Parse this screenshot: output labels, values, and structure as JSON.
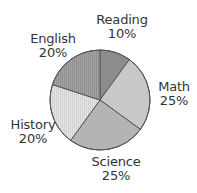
{
  "chart_data": {
    "type": "pie",
    "title": "",
    "categories": [
      "Reading",
      "Math",
      "Science",
      "History",
      "English"
    ],
    "values": [
      10,
      25,
      25,
      20,
      20
    ],
    "unit": "%",
    "start_angle": "12 o'clock",
    "direction": "clockwise",
    "slice_angles_note": "Slice angles are computed from the labeled percentages (which sum to 100%) and agree with the drawn slices to within reading precision.",
    "slices": [
      {
        "label": "Reading",
        "value": 10,
        "value_label": "10%",
        "fill": "#8c8c8c",
        "pattern": "none"
      },
      {
        "label": "Math",
        "value": 25,
        "value_label": "25%",
        "fill": "#c8c8c8",
        "pattern": "none"
      },
      {
        "label": "Science",
        "value": 25,
        "value_label": "25%",
        "fill": "#b4b4b4",
        "pattern": "none"
      },
      {
        "label": "History",
        "value": 20,
        "value_label": "20%",
        "fill": "#e2e2e2",
        "pattern": "vertical-hatch"
      },
      {
        "label": "English",
        "value": 20,
        "value_label": "20%",
        "fill": "#9e9e9e",
        "pattern": "vertical-hatch"
      }
    ],
    "legend": "none (direct labels)",
    "outline_color": "#555555"
  },
  "labels": {
    "reading": {
      "name": "Reading",
      "pct": "10%"
    },
    "math": {
      "name": "Math",
      "pct": "25%"
    },
    "science": {
      "name": "Science",
      "pct": "25%"
    },
    "history": {
      "name": "History",
      "pct": "20%"
    },
    "english": {
      "name": "English",
      "pct": "20%"
    }
  }
}
